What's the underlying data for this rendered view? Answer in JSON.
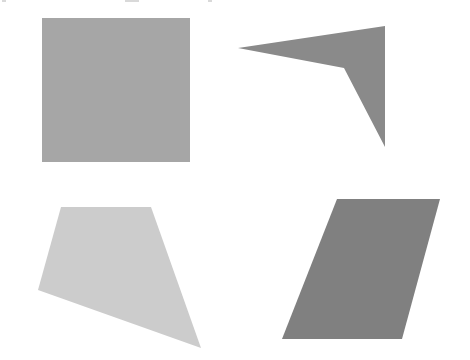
{
  "canvas": {
    "width": 470,
    "height": 360,
    "background": "#ffffff"
  },
  "figure": {
    "shapes": [
      {
        "id": "square",
        "kind": "square",
        "position": "top-left",
        "fill": "#a6a6a6",
        "points": [
          [
            42,
            18
          ],
          [
            190,
            18
          ],
          [
            190,
            162
          ],
          [
            42,
            162
          ]
        ]
      },
      {
        "id": "dart",
        "kind": "concave-quadrilateral",
        "position": "top-right",
        "fill": "#8a8a8a",
        "points": [
          [
            238,
            48
          ],
          [
            385,
            26
          ],
          [
            385,
            147
          ],
          [
            344,
            68
          ]
        ]
      },
      {
        "id": "trapezoid",
        "kind": "irregular-quadrilateral",
        "position": "bottom-left",
        "fill": "#cccccc",
        "points": [
          [
            61,
            207
          ],
          [
            151,
            207
          ],
          [
            201,
            348
          ],
          [
            38,
            290
          ]
        ]
      },
      {
        "id": "parallelogram",
        "kind": "parallelogram",
        "position": "bottom-right",
        "fill": "#808080",
        "points": [
          [
            337,
            199
          ],
          [
            440,
            199
          ],
          [
            402,
            339
          ],
          [
            282,
            339
          ]
        ]
      }
    ]
  },
  "top_edge_fragments": [
    {
      "x": 2,
      "width": 4
    },
    {
      "x": 125,
      "width": 14
    },
    {
      "x": 208,
      "width": 4
    }
  ]
}
